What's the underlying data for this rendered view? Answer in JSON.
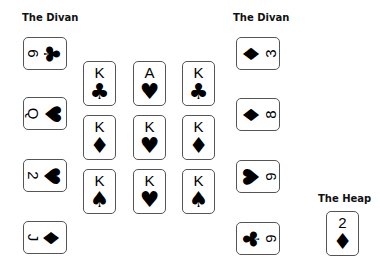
{
  "labels": {
    "left_divan": "The Divan",
    "right_divan": "The Divan",
    "heap": "The Heap"
  },
  "left_divan": [
    {
      "rank": "6",
      "suit": "♣",
      "suit_name": "clubs"
    },
    {
      "rank": "Q",
      "suit": "♥",
      "suit_name": "hearts"
    },
    {
      "rank": "2",
      "suit": "♥",
      "suit_name": "hearts"
    },
    {
      "rank": "J",
      "suit": "♦",
      "suit_name": "diamonds"
    }
  ],
  "center": [
    {
      "rank": "K",
      "suit": "♣",
      "suit_name": "clubs"
    },
    {
      "rank": "A",
      "suit": "♥",
      "suit_name": "hearts"
    },
    {
      "rank": "K",
      "suit": "♣",
      "suit_name": "clubs"
    },
    {
      "rank": "K",
      "suit": "♦",
      "suit_name": "diamonds"
    },
    {
      "rank": "K",
      "suit": "♥",
      "suit_name": "hearts"
    },
    {
      "rank": "K",
      "suit": "♦",
      "suit_name": "diamonds"
    },
    {
      "rank": "K",
      "suit": "♠",
      "suit_name": "spades"
    },
    {
      "rank": "K",
      "suit": "♥",
      "suit_name": "hearts"
    },
    {
      "rank": "K",
      "suit": "♠",
      "suit_name": "spades"
    }
  ],
  "right_divan": [
    {
      "rank": "3",
      "suit": "♦",
      "suit_name": "diamonds"
    },
    {
      "rank": "8",
      "suit": "♦",
      "suit_name": "diamonds"
    },
    {
      "rank": "9",
      "suit": "♥",
      "suit_name": "hearts"
    },
    {
      "rank": "9",
      "suit": "♣",
      "suit_name": "clubs"
    }
  ],
  "heap": {
    "rank": "2",
    "suit": "♦",
    "suit_name": "diamonds"
  }
}
